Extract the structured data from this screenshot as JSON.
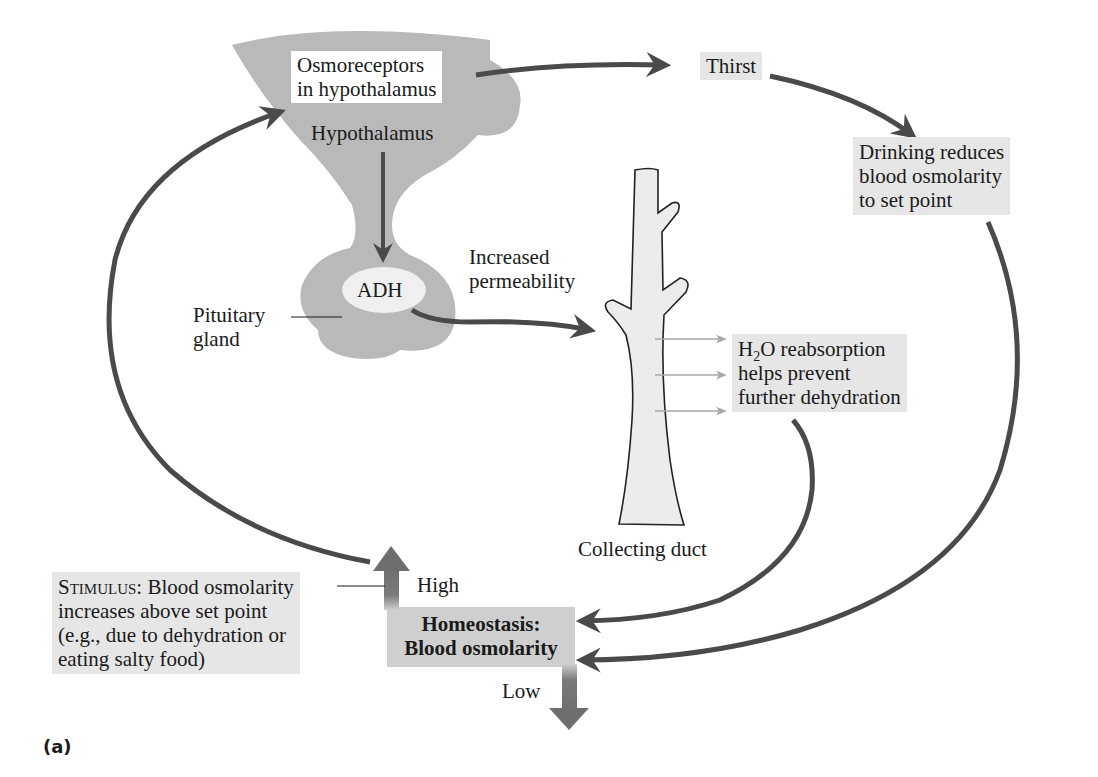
{
  "figure": {
    "panel_label": "(a)",
    "colors": {
      "arrow": "#4a4a4a",
      "tissue_gray": "#b9b9b9",
      "box_gray": "#e6e6e6",
      "homeostasis_box": "#cfcfcf",
      "duct_fill": "#ececec",
      "water_arrow": "#a8a8a8"
    }
  },
  "nodes": {
    "osmoreceptors": {
      "line1": "Osmoreceptors",
      "line2": "in hypothalamus"
    },
    "hypothalamus": "Hypothalamus",
    "adh": "ADH",
    "pituitary": {
      "line1": "Pituitary",
      "line2": "gland"
    },
    "increased_permeability": {
      "line1": "Increased",
      "line2": "permeability"
    },
    "collecting_duct": "Collecting duct",
    "thirst": "Thirst",
    "drinking": {
      "line1": "Drinking reduces",
      "line2": "blood osmolarity",
      "line3": "to set point"
    },
    "reabsorption": {
      "line1_pre": "H",
      "line1_sub": "2",
      "line1_post": "O reabsorption",
      "line2": "helps prevent",
      "line3": "further dehydration"
    },
    "stimulus": {
      "label": "Stimulus",
      "line1_rest": ": Blood osmolarity",
      "line2": "increases above set point",
      "line3": "(e.g., due to dehydration or",
      "line4": "eating salty food)"
    },
    "homeostasis": {
      "line1": "Homeostasis:",
      "line2": "Blood osmolarity"
    },
    "high": "High",
    "low": "Low"
  }
}
